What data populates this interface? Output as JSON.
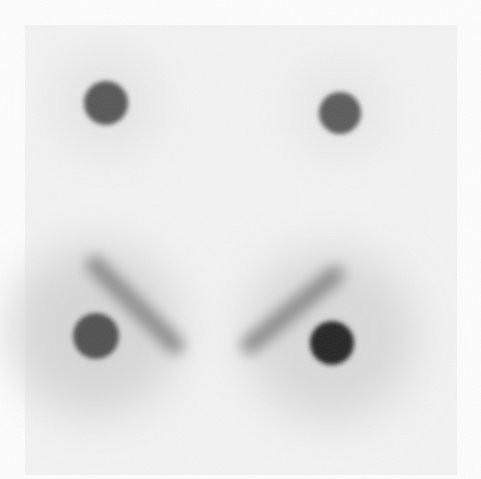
{
  "image": {
    "description": "Grayscale autoradiograph-style image with four dark circular spots and two diagonal smears",
    "background": "#ffffff",
    "film_region": {
      "x": 25,
      "y": 25,
      "w": 432,
      "h": 450,
      "tone": "#f4f4f4"
    },
    "spots": [
      {
        "name": "spot-top-left",
        "cx": 106,
        "cy": 103,
        "r": 22,
        "color": "#555555"
      },
      {
        "name": "spot-top-right",
        "cx": 340,
        "cy": 113,
        "r": 21,
        "color": "#5a5a5a"
      },
      {
        "name": "spot-bottom-left",
        "cx": 96,
        "cy": 336,
        "r": 23,
        "color": "#505050"
      },
      {
        "name": "spot-bottom-right",
        "cx": 332,
        "cy": 343,
        "r": 22,
        "color": "#222222"
      }
    ],
    "smears": [
      {
        "name": "smear-left",
        "x1": 95,
        "y1": 265,
        "x2": 175,
        "y2": 345,
        "width": 18,
        "color": "#8a8a8a"
      },
      {
        "name": "smear-right",
        "x1": 335,
        "y1": 275,
        "x2": 250,
        "y2": 345,
        "width": 18,
        "color": "#8a8a8a"
      }
    ],
    "halos": [
      {
        "cx": 95,
        "cy": 330,
        "r": 85,
        "color": "#d8d8d8"
      },
      {
        "cx": 330,
        "cy": 335,
        "r": 85,
        "color": "#dadada"
      },
      {
        "cx": 106,
        "cy": 103,
        "r": 50,
        "color": "#e6e6e6"
      },
      {
        "cx": 340,
        "cy": 110,
        "r": 45,
        "color": "#e8e8e8"
      }
    ]
  }
}
